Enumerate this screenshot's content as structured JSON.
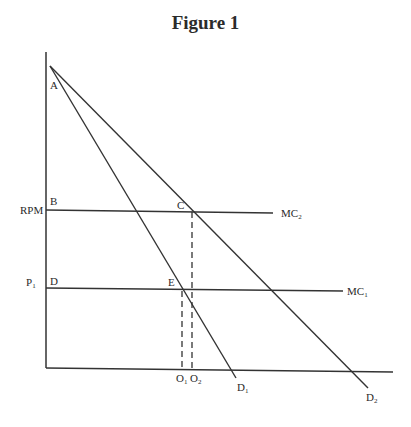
{
  "figure": {
    "title": "Figure 1"
  },
  "axes": {
    "y_axis_labels": {
      "rpm": "RPM",
      "p1_main": "P",
      "p1_sub": "1"
    },
    "x_axis_labels": {
      "o1_main": "O",
      "o1_sub": "1",
      "o2_main": "O",
      "o2_sub": "2"
    }
  },
  "points": {
    "a": "A",
    "b": "B",
    "c": "C",
    "d": "D",
    "e": "E"
  },
  "curves": {
    "mc2_main": "MC",
    "mc2_sub": "2",
    "mc1_main": "MC",
    "mc1_sub": "1",
    "d1_main": "D",
    "d1_sub": "1",
    "d2_main": "D",
    "d2_sub": "2"
  },
  "colors": {
    "line": "#333333",
    "background": "#ffffff"
  }
}
